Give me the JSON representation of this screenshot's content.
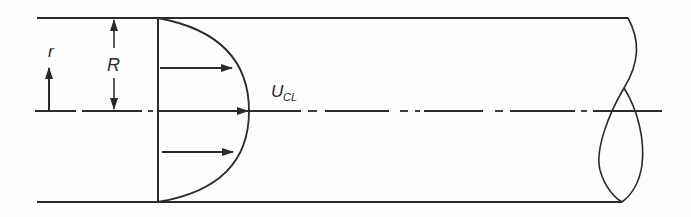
{
  "diagram": {
    "labels": {
      "radial_coordinate": "r",
      "pipe_radius": "R",
      "centerline_velocity_main": "U",
      "centerline_velocity_sub": "CL"
    },
    "colors": {
      "stroke": "#2a2a2a",
      "background": "#fdfdfd"
    },
    "geometry": {
      "pipe_top_y": 18,
      "pipe_bottom_y": 202,
      "centerline_y": 111,
      "pipe_left_x": 37,
      "profile_base_x": 158,
      "profile_apex_x": 249
    },
    "elements": [
      "pipe-wall-top",
      "pipe-wall-bottom",
      "centerline",
      "velocity-profile-parabola",
      "velocity-arrows",
      "radius-dimension-R",
      "radial-coordinate-arrow-r",
      "pipe-break-symbol"
    ]
  }
}
